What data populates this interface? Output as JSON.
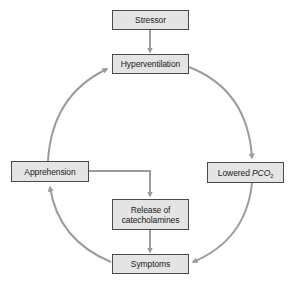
{
  "diagram": {
    "type": "cycle-flowchart",
    "colors": {
      "node_fill": "#e4e4e4",
      "node_border": "#4a4a4a",
      "arrow": "#9c9c9c",
      "text": "#222222",
      "background": "#ffffff"
    },
    "nodes": {
      "stressor": {
        "label": "Stressor"
      },
      "hyperventilation": {
        "label": "Hyperventilation"
      },
      "lowered_pco2": {
        "label_prefix": "Lowered ",
        "label_italic": "PCO",
        "label_sub": "2"
      },
      "symptoms": {
        "label": "Symptoms"
      },
      "apprehension": {
        "label": "Apprehension"
      },
      "release": {
        "line1": "Release of",
        "line2": "catecholamines"
      }
    },
    "edges": [
      {
        "from": "Stressor",
        "to": "Hyperventilation"
      },
      {
        "from": "Hyperventilation",
        "to": "Lowered PCO2"
      },
      {
        "from": "Lowered PCO2",
        "to": "Symptoms"
      },
      {
        "from": "Symptoms",
        "to": "Apprehension"
      },
      {
        "from": "Apprehension",
        "to": "Hyperventilation"
      },
      {
        "from": "Apprehension",
        "to": "Release of catecholamines"
      },
      {
        "from": "Release of catecholamines",
        "to": "Symptoms"
      }
    ]
  }
}
